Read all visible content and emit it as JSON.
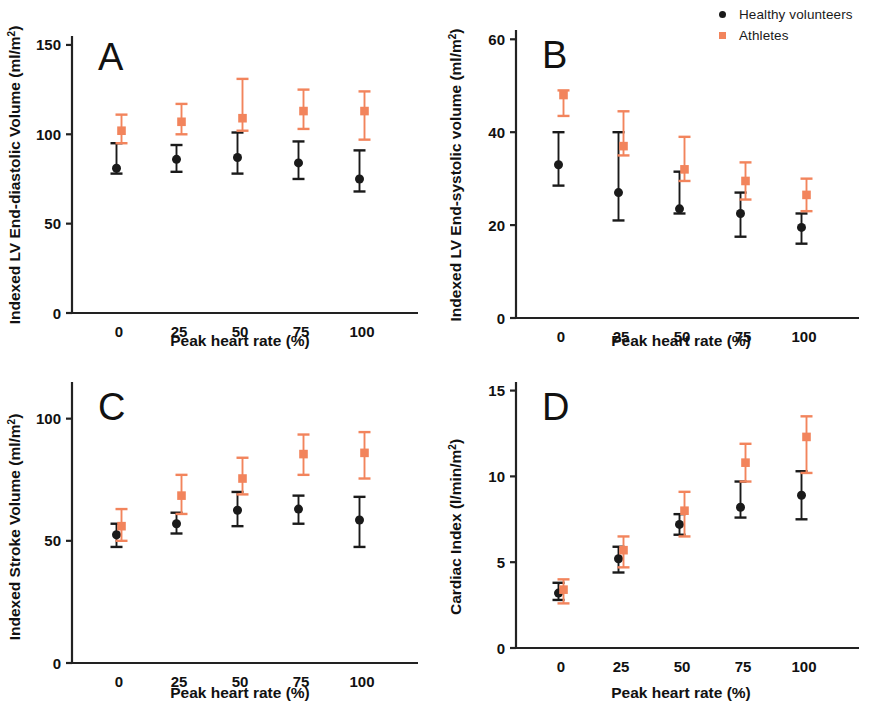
{
  "legend": {
    "items": [
      {
        "label": "Healthy volunteers",
        "color": "#1a1a1a",
        "marker": "circle-marker-icon"
      },
      {
        "label": "Athletes",
        "color": "#F2845C",
        "marker": "square-marker-icon"
      }
    ]
  },
  "colors": {
    "healthy": "#1a1a1a",
    "athletes": "#F2845C",
    "axis": "#222222"
  },
  "panels": {
    "A": {
      "letter": "A",
      "ylabel": "Indexed LV End-diastolic Volume (ml/m",
      "ylabel_sup": "2",
      "ylabel_tail": ")",
      "xlabel": "Peak heart rate (%)",
      "yticks": [
        "0",
        "50",
        "100",
        "150"
      ],
      "xticks": [
        "0",
        "25",
        "50",
        "75",
        "100"
      ]
    },
    "B": {
      "letter": "B",
      "ylabel": "Indexed LV End-systolic volume (ml/m",
      "ylabel_sup": "2",
      "ylabel_tail": ")",
      "xlabel": "Peak heart rate (%)",
      "yticks": [
        "0",
        "20",
        "40",
        "60"
      ],
      "xticks": [
        "0",
        "25",
        "50",
        "75",
        "100"
      ]
    },
    "C": {
      "letter": "C",
      "ylabel": "Indexed Stroke Volume (ml/m",
      "ylabel_sup": "2",
      "ylabel_tail": ")",
      "xlabel": "Peak heart rate (%)",
      "yticks": [
        "0",
        "50",
        "100"
      ],
      "xticks": [
        "0",
        "25",
        "50",
        "75",
        "100"
      ]
    },
    "D": {
      "letter": "D",
      "ylabel": "Cardiac Index (l/min/m",
      "ylabel_sup": "2",
      "ylabel_tail": ")",
      "xlabel": "Peak heart rate (%)",
      "yticks": [
        "0",
        "5",
        "10",
        "15"
      ],
      "xticks": [
        "0",
        "25",
        "50",
        "75",
        "100"
      ]
    }
  },
  "chart_data": [
    {
      "panel": "A",
      "type": "scatter",
      "title": "A",
      "xlabel": "Peak heart rate (%)",
      "ylabel": "Indexed LV End-diastolic Volume (ml/m2)",
      "x": [
        0,
        25,
        50,
        75,
        100
      ],
      "xticks": [
        0,
        25,
        50,
        75,
        100
      ],
      "yticks": [
        0,
        50,
        100,
        150
      ],
      "ylim": [
        0,
        155
      ],
      "grid": false,
      "legend_position": "figure-top-right",
      "series": [
        {
          "name": "Healthy volunteers",
          "color": "#1a1a1a",
          "marker": "circle",
          "values": [
            81,
            86,
            87,
            84,
            75
          ],
          "err_low": [
            78,
            79,
            78,
            75,
            68
          ],
          "err_high": [
            95,
            94,
            101,
            96,
            91
          ]
        },
        {
          "name": "Athletes",
          "color": "#F2845C",
          "marker": "square",
          "values": [
            102,
            107,
            109,
            113,
            113
          ],
          "err_low": [
            95,
            100,
            102,
            103,
            97
          ],
          "err_high": [
            111,
            117,
            131,
            125,
            124
          ]
        }
      ]
    },
    {
      "panel": "B",
      "type": "scatter",
      "title": "B",
      "xlabel": "Peak heart rate (%)",
      "ylabel": "Indexed LV End-systolic volume (ml/m2)",
      "x": [
        0,
        25,
        50,
        75,
        100
      ],
      "xticks": [
        0,
        25,
        50,
        75,
        100
      ],
      "yticks": [
        0,
        20,
        40,
        60
      ],
      "ylim": [
        0,
        62
      ],
      "grid": false,
      "legend_position": "figure-top-right",
      "series": [
        {
          "name": "Healthy volunteers",
          "color": "#1a1a1a",
          "marker": "circle",
          "values": [
            33,
            27,
            23.5,
            22.5,
            19.5
          ],
          "err_low": [
            28.5,
            21,
            22.5,
            17.5,
            16
          ],
          "err_high": [
            40,
            40,
            31.5,
            27,
            22.5
          ]
        },
        {
          "name": "Athletes",
          "color": "#F2845C",
          "marker": "square",
          "values": [
            48,
            37,
            32,
            29.5,
            26.5
          ],
          "err_low": [
            43.5,
            35,
            29.5,
            25.5,
            23
          ],
          "err_high": [
            49,
            44.5,
            39,
            33.5,
            30
          ]
        }
      ]
    },
    {
      "panel": "C",
      "type": "scatter",
      "title": "C",
      "xlabel": "Peak heart rate (%)",
      "ylabel": "Indexed Stroke Volume (ml/m2)",
      "x": [
        0,
        25,
        50,
        75,
        100
      ],
      "xticks": [
        0,
        25,
        50,
        75,
        100
      ],
      "yticks": [
        0,
        50,
        100
      ],
      "ylim": [
        0,
        115
      ],
      "grid": false,
      "legend_position": "figure-top-right",
      "series": [
        {
          "name": "Healthy volunteers",
          "color": "#1a1a1a",
          "marker": "circle",
          "values": [
            52.5,
            57,
            62.5,
            63,
            58.5
          ],
          "err_low": [
            47.5,
            53,
            56,
            57,
            47.5
          ],
          "err_high": [
            57,
            61.5,
            70,
            68.5,
            68
          ]
        },
        {
          "name": "Athletes",
          "color": "#F2845C",
          "marker": "square",
          "values": [
            56,
            68.5,
            75.5,
            85.5,
            86
          ],
          "err_low": [
            50,
            61,
            69,
            77,
            75.5
          ],
          "err_high": [
            63,
            77,
            84,
            93.5,
            94.5
          ]
        }
      ]
    },
    {
      "panel": "D",
      "type": "scatter",
      "title": "D",
      "xlabel": "Peak heart rate (%)",
      "ylabel": "Cardiac Index (l/min/m2)",
      "x": [
        0,
        25,
        50,
        75,
        100
      ],
      "xticks": [
        0,
        25,
        50,
        75,
        100
      ],
      "yticks": [
        0,
        5,
        10,
        15
      ],
      "ylim": [
        0,
        15.5
      ],
      "grid": false,
      "legend_position": "figure-top-right",
      "series": [
        {
          "name": "Healthy volunteers",
          "color": "#1a1a1a",
          "marker": "circle",
          "values": [
            3.2,
            5.2,
            7.2,
            8.2,
            8.9
          ],
          "err_low": [
            2.8,
            4.4,
            6.6,
            7.6,
            7.5
          ],
          "err_high": [
            3.8,
            5.9,
            7.8,
            9.7,
            10.3
          ]
        },
        {
          "name": "Athletes",
          "color": "#F2845C",
          "marker": "square",
          "values": [
            3.4,
            5.7,
            8.0,
            10.8,
            12.3
          ],
          "err_low": [
            2.6,
            4.7,
            6.5,
            9.7,
            10.2
          ],
          "err_high": [
            4.0,
            6.5,
            9.1,
            11.9,
            13.5
          ]
        }
      ]
    }
  ]
}
